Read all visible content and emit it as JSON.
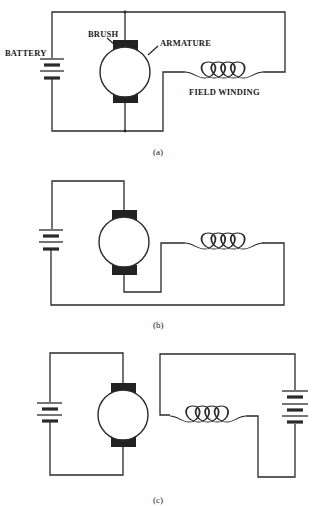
{
  "diagram": {
    "type": "dc-motor-field-connections",
    "panels": [
      {
        "caption": "(a)",
        "configuration": "shunt (field in parallel with armature)",
        "labels": {
          "battery": "BATTERY",
          "brush": "BRUSH",
          "armature": "ARMATURE",
          "field": "FIELD WINDING"
        }
      },
      {
        "caption": "(b)",
        "configuration": "series (field in series with armature)"
      },
      {
        "caption": "(c)",
        "configuration": "separately excited (field has own battery)"
      }
    ]
  }
}
